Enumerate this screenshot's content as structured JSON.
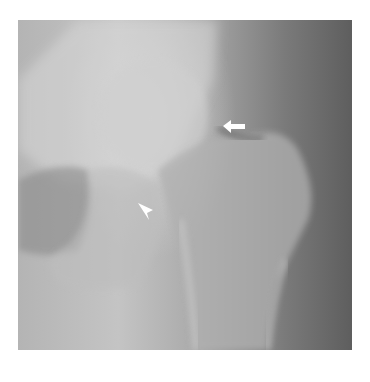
{
  "image": {
    "description": "Hip radiograph (AP view) showing femoral head, neck and greater trochanter",
    "annotations": [
      {
        "type": "arrow",
        "direction": "left",
        "color": "#ffffff"
      },
      {
        "type": "arrowhead",
        "direction": "up-left",
        "color": "#ffffff"
      }
    ]
  }
}
